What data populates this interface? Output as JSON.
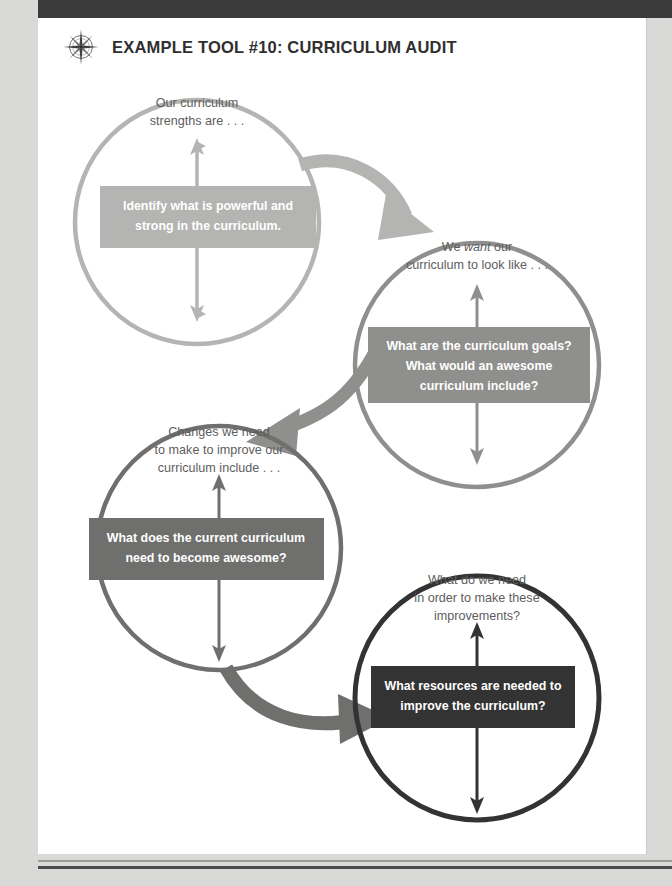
{
  "page": {
    "header": {
      "icon": "compass-rose-icon",
      "title": "EXAMPLE TOOL #10: CURRICULUM AUDIT"
    },
    "colors": {
      "page_background": "#d9d9d7",
      "sheet_background": "#ffffff",
      "topbar": "#3b3b3b",
      "title_text": "#2f2f2f",
      "heading_text": "#5d5d5d",
      "box_text": "#ffffff",
      "step1": "#b4b4b2",
      "step2": "#8f8f8d",
      "step3": "#6f6f6d",
      "step4": "#333333"
    }
  },
  "diagram": {
    "type": "cycle-of-four-circles",
    "steps": [
      {
        "index": 1,
        "heading_lines": [
          "Our curriculum",
          "strengths are . . ."
        ],
        "heading_plain": "Our curriculum strengths are . . .",
        "box_lines": [
          "Identify what is powerful and",
          "strong in the curriculum."
        ],
        "box_text": "Identify what is powerful and strong in the curriculum.",
        "color": "#b4b4b2",
        "cx": 197,
        "cy": 222,
        "r": 128,
        "box": {
          "x": 100,
          "y": 186,
          "w": 216,
          "h": 62
        },
        "arrow": {
          "top": 140,
          "bottom": 316
        }
      },
      {
        "index": 2,
        "heading_lines": [
          "We want our",
          "curriculum to look like . . ."
        ],
        "heading_plain": "We want our curriculum to look like . . .",
        "heading_italic_word": "want",
        "box_lines": [
          "What are the curriculum goals?",
          "What would an awesome",
          "curriculum include?"
        ],
        "box_text": "What are the curriculum goals? What would an awesome curriculum include?",
        "color": "#8f8f8d",
        "cx": 477,
        "cy": 365,
        "r": 128,
        "box": {
          "x": 368,
          "y": 327,
          "w": 222,
          "h": 76
        },
        "arrow": {
          "top": 283,
          "bottom": 460
        }
      },
      {
        "index": 3,
        "heading_lines": [
          "Changes we need",
          "to make to improve our",
          "curriculum include . . ."
        ],
        "heading_plain": "Changes we need to make to improve our curriculum include . . .",
        "box_lines": [
          "What does the current curriculum",
          "need to become awesome?"
        ],
        "box_text": "What does the current curriculum need to become awesome?",
        "color": "#6f6f6d",
        "cx": 219,
        "cy": 548,
        "r": 128,
        "box": {
          "x": 89,
          "y": 518,
          "w": 235,
          "h": 62
        },
        "arrow": {
          "top": 458,
          "bottom": 660
        }
      },
      {
        "index": 4,
        "heading_lines": [
          "What do we need",
          "in order to make these",
          "improvements?"
        ],
        "heading_plain": "What do we need in order to make these improvements?",
        "box_lines": [
          "What resources are needed to",
          "improve the curriculum?"
        ],
        "box_text": "What resources are needed to improve the curriculum?",
        "color": "#333333",
        "cx": 477,
        "cy": 698,
        "r": 128,
        "box": {
          "x": 371,
          "y": 666,
          "w": 204,
          "h": 62
        },
        "arrow": {
          "top": 614,
          "bottom": 812
        }
      }
    ],
    "connectors": [
      {
        "from": 1,
        "to": 2,
        "color": "#b4b4b2",
        "direction": "right-down"
      },
      {
        "from": 2,
        "to": 3,
        "color": "#8f8f8d",
        "direction": "left-down"
      },
      {
        "from": 3,
        "to": 4,
        "color": "#6f6f6d",
        "direction": "right-down"
      }
    ]
  }
}
